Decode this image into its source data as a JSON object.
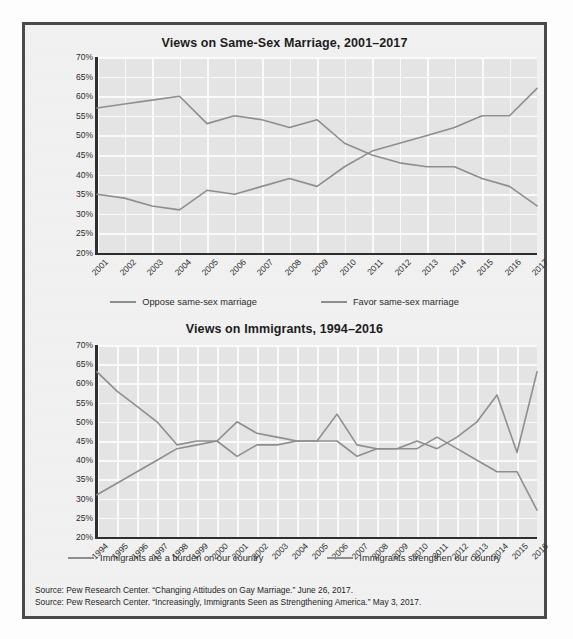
{
  "figure": {
    "sources": [
      "Source: Pew Research Center. “Changing Attitudes on Gay Marriage.” June 26, 2017.",
      "Source: Pew Research Center. “Increasingly, Immigrants Seen as Strengthening America.” May 3, 2017."
    ],
    "line_color": "#8e8e8e",
    "plot_bg": "#e4e4e4",
    "grid_color": "#fafafa",
    "axis_color": "#2e2e2e",
    "frame_color": "#4a4a4a"
  },
  "chart_data": [
    {
      "type": "line",
      "title": "Views on Same-Sex Marriage, 2001–2017",
      "xlabel": "",
      "ylabel": "",
      "ylim": [
        20,
        70
      ],
      "yticks": [
        "20%",
        "25%",
        "30%",
        "35%",
        "40%",
        "45%",
        "50%",
        "55%",
        "60%",
        "65%",
        "70%"
      ],
      "ytick_values": [
        20,
        25,
        30,
        35,
        40,
        45,
        50,
        55,
        60,
        65,
        70
      ],
      "grid": true,
      "legend_position": "bottom",
      "categories": [
        "2001",
        "2002",
        "2003",
        "2004",
        "2005",
        "2006",
        "2007",
        "2008",
        "2009",
        "2010",
        "2011",
        "2012",
        "2013",
        "2014",
        "2015",
        "2016",
        "2017"
      ],
      "series": [
        {
          "name": "Oppose same-sex marriage",
          "values": [
            57,
            58,
            59,
            60,
            53,
            55,
            54,
            52,
            54,
            48,
            45,
            43,
            42,
            42,
            39,
            37,
            32
          ]
        },
        {
          "name": "Favor same-sex marriage",
          "values": [
            35,
            34,
            32,
            31,
            36,
            35,
            37,
            39,
            37,
            42,
            46,
            48,
            50,
            52,
            55,
            55,
            62
          ]
        }
      ]
    },
    {
      "type": "line",
      "title": "Views on Immigrants, 1994–2016",
      "xlabel": "",
      "ylabel": "",
      "ylim": [
        20,
        70
      ],
      "yticks": [
        "20%",
        "25%",
        "30%",
        "35%",
        "40%",
        "45%",
        "50%",
        "55%",
        "60%",
        "65%",
        "70%"
      ],
      "ytick_values": [
        20,
        25,
        30,
        35,
        40,
        45,
        50,
        55,
        60,
        65,
        70
      ],
      "grid": true,
      "legend_position": "bottom",
      "categories": [
        "1994",
        "1995",
        "1996",
        "1997",
        "1998",
        "1999",
        "2000",
        "2001",
        "2002",
        "2003",
        "2004",
        "2005",
        "2006",
        "2007",
        "2008",
        "2009",
        "2010",
        "2011",
        "2012",
        "2013",
        "2014",
        "2015",
        "2016"
      ],
      "series": [
        {
          "name": "Immigrants are a burden on our country",
          "values": [
            63,
            58,
            54,
            50,
            44,
            45,
            45,
            50,
            47,
            46,
            45,
            45,
            45,
            41,
            43,
            43,
            43,
            46,
            43,
            40,
            37,
            37,
            27
          ]
        },
        {
          "name": "Immigrants strengthen our country",
          "values": [
            31,
            34,
            37,
            40,
            43,
            44,
            45,
            41,
            44,
            44,
            45,
            45,
            52,
            44,
            43,
            43,
            45,
            43,
            46,
            50,
            57,
            42,
            63
          ]
        }
      ]
    }
  ]
}
